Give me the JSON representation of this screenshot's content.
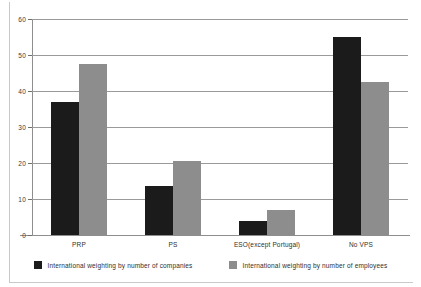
{
  "chart_data": {
    "type": "bar",
    "title": "",
    "xlabel": "",
    "ylabel": "",
    "ylim": [
      0,
      60
    ],
    "yticks": [
      0,
      10,
      20,
      30,
      40,
      50,
      60
    ],
    "ytick_labels": [
      "0",
      "10",
      "20",
      "30",
      "40",
      "50",
      "60"
    ],
    "grid": true,
    "legend_position": "bottom",
    "categories": [
      "PRP",
      "PS",
      "ESO(except Portugal)",
      "No VPS"
    ],
    "series": [
      {
        "name": "International weighting by number of companies",
        "color": "#1b1b1b",
        "values": [
          37,
          13.5,
          4,
          55
        ]
      },
      {
        "name": "International weighting by number of employees",
        "color": "#8d8d8d",
        "values": [
          47.5,
          20.5,
          7,
          42.5
        ]
      }
    ]
  },
  "legend": {
    "items": [
      {
        "label": "International weighting by number of companies",
        "swatch": "legend-swatch-dark"
      },
      {
        "label": "International weighting by number of employees",
        "swatch": "legend-swatch-gray"
      }
    ]
  },
  "colors": {
    "series_companies": "#1b1b1b",
    "series_employees": "#8d8d8d",
    "gridline": "#9a9a9a",
    "axis": "#8e8e8e",
    "frame": "#c9c9c9",
    "text": "#2f2f2f",
    "background": "#ffffff"
  }
}
